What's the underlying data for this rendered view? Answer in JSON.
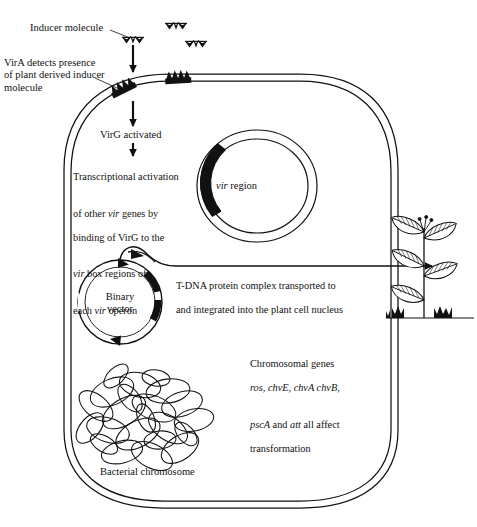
{
  "diagram": {
    "stroke_color": "#111111",
    "fill_color": "#111111",
    "background": "#ffffff"
  },
  "labels": {
    "inducer_molecule": "Inducer molecule",
    "vira_detects": "VirA detects presence\nof plant derived inducer\nmolecule",
    "virg_activated": "VirG activated",
    "transcriptional_activation_line1": "Transcriptional activation",
    "transcriptional_activation_line2_a": "of other ",
    "transcriptional_activation_line2_vir": "vir",
    "transcriptional_activation_line2_b": " genes by",
    "transcriptional_activation_line3": "binding of VirG to the",
    "transcriptional_activation_line4_vir": "vir",
    "transcriptional_activation_line4_b": " box regions of",
    "transcriptional_activation_line5_a": "each ",
    "transcriptional_activation_line5_vir": "vir",
    "transcriptional_activation_line5_b": " operon",
    "vir_region_italic": "vir",
    "vir_region_rest": " region",
    "binary_vector": "Binary\nvector",
    "tdna_line1": "T-DNA protein complex  transported to",
    "tdna_line2": "and  integrated into the plant cell nucleus",
    "chromosomal_line1": "Chromosomal genes",
    "chromosomal_line2_genes": "ros, chvE, chvA chvB,",
    "chromosomal_line3_psca": "pscA",
    "chromosomal_line3_and": " and ",
    "chromosomal_line3_att": "att",
    "chromosomal_line3_rest": " all affect",
    "chromosomal_line4": "transformation",
    "bacterial_chromosome": "Bacterial chromosome"
  },
  "elements": {
    "inducer_molecules_count": 3,
    "vira_receptors_count": 2,
    "arrows": [
      "inducer-to-membrane",
      "membrane-to-virg",
      "virg-to-transcription",
      "binary-vector-to-plant"
    ],
    "plasmids": [
      "vir-plasmid",
      "binary-vector"
    ],
    "cell_shape": "rounded-rectangle-double-membrane",
    "plant": "leafy-plant-with-roots"
  }
}
